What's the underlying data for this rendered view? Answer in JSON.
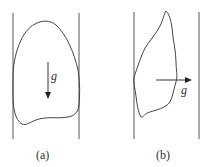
{
  "figure": {
    "panels": [
      {
        "id": "a",
        "caption": "(a)",
        "gravity_symbol": "g",
        "gravity_direction": "down",
        "description": "Bubble between vertical walls with gravity pointing downward"
      },
      {
        "id": "b",
        "caption": "(b)",
        "gravity_symbol": "g",
        "gravity_direction": "right",
        "description": "Bubble between vertical walls with gravity pointing to the right"
      }
    ],
    "colors": {
      "line": "#444444",
      "background": "#ffffff"
    }
  }
}
